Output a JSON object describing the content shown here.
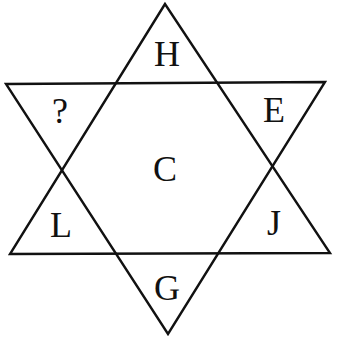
{
  "puzzle": {
    "type": "hexagram letter puzzle",
    "stroke_color": "#111111",
    "background_color": "#ffffff",
    "cells": {
      "top": "H",
      "upper_left": "?",
      "upper_right": "E",
      "center": "C",
      "lower_left": "L",
      "lower_right": "J",
      "bottom": "G"
    }
  }
}
